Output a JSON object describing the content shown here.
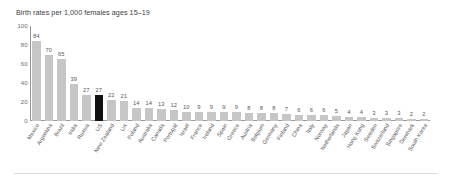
{
  "chart_data": {
    "type": "bar",
    "title": "Birth rates per 1,000 females ages 15–19",
    "xlabel": "",
    "ylabel": "",
    "ylim": [
      0,
      100
    ],
    "yticks": [
      0,
      20,
      40,
      60,
      80,
      100
    ],
    "grid": false,
    "legend": "none",
    "value_labels": true,
    "highlight_category": "US",
    "colors": {
      "bar": "#c6c6c6",
      "highlight_bar": "#121212",
      "axis": "#9a9a9a",
      "text": "#555555",
      "title": "#3d3d3d"
    },
    "categories": [
      "Mexico",
      "Argentina",
      "Brazil",
      "India",
      "Russia",
      "US",
      "New Zealand",
      "UK",
      "Poland",
      "Australia",
      "Canada",
      "Portugal",
      "Israel",
      "France",
      "Ireland",
      "Spain",
      "Greece",
      "Austria",
      "Belgium",
      "Germany",
      "Finland",
      "China",
      "Italy",
      "Norway",
      "Netherlands",
      "Japan",
      "Hong Kong",
      "Sweden",
      "Switzerland",
      "Singapore",
      "Denmark",
      "South Korea"
    ],
    "values": [
      84,
      70,
      65,
      39,
      27,
      27,
      22,
      21,
      14,
      14,
      13,
      12,
      10,
      9,
      9,
      9,
      9,
      8,
      8,
      8,
      7,
      6,
      6,
      6,
      5,
      4,
      4,
      3,
      3,
      3,
      2,
      2
    ]
  }
}
